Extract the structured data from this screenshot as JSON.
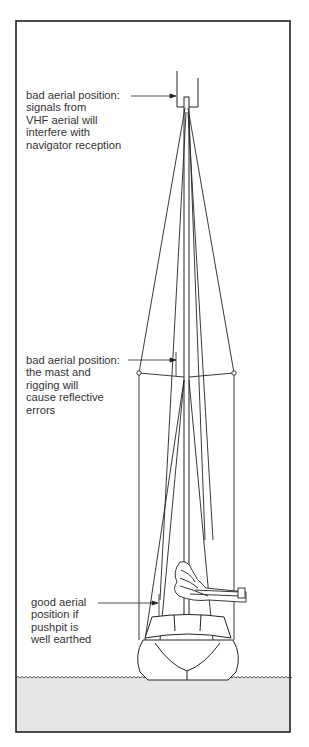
{
  "diagram": {
    "type": "sailboat aerial positioning illustration",
    "colors": {
      "line": "#222222",
      "water": "#e6e6e6",
      "background": "#ffffff",
      "text": "#333333"
    },
    "labels": [
      {
        "id": "top",
        "text": "bad aerial position:\nsignals from\nVHF aerial will\ninterfere with\nnavigator reception"
      },
      {
        "id": "middle",
        "text": "bad aerial position:\nthe mast and\nrigging will\ncause reflective\nerrors"
      },
      {
        "id": "bottom",
        "text": "good aerial\nposition if\npushpit is\nwell earthed"
      }
    ]
  }
}
